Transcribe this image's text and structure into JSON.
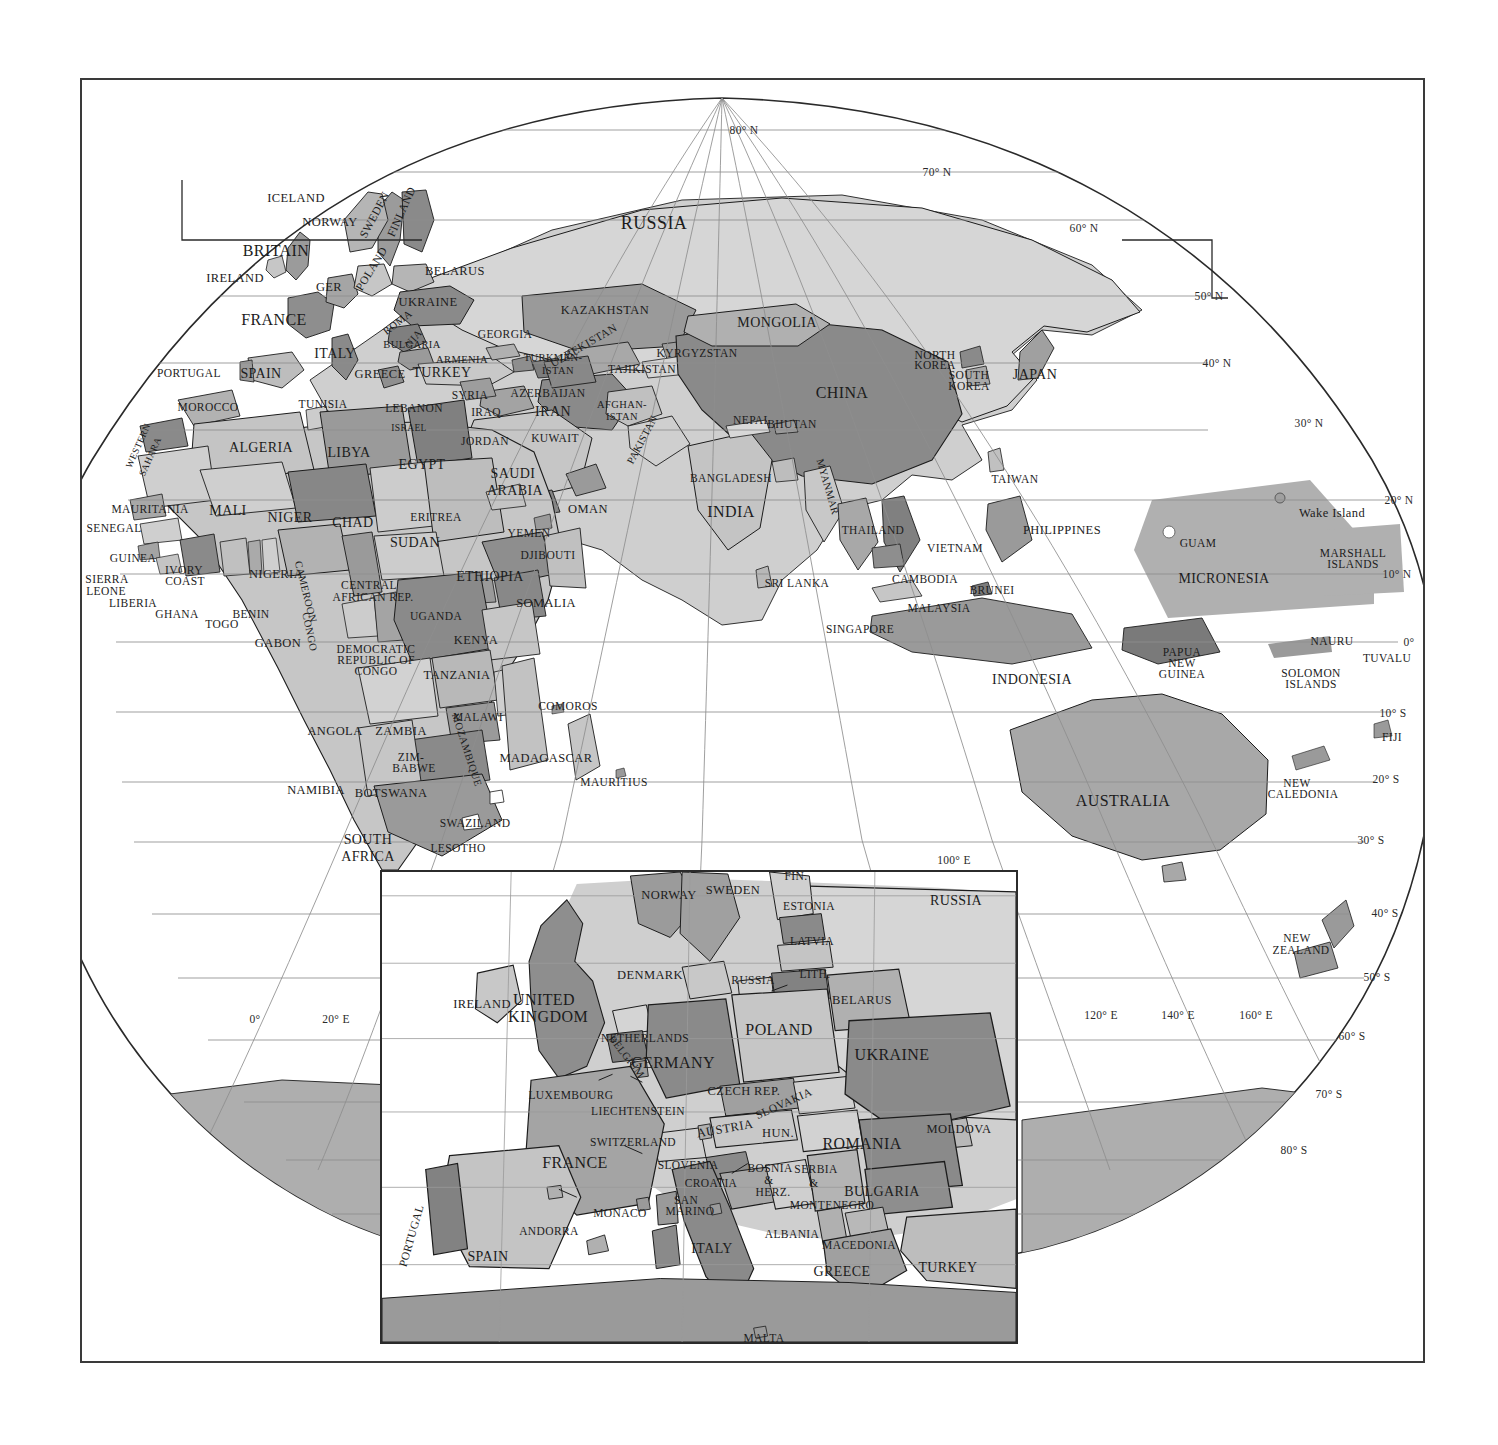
{
  "plate": {
    "title": "World Map — Eastern Hemisphere with Europe Inset",
    "projection": "oblique globe / Bonne-like",
    "frame_color": "#3a3a3a",
    "background": "#ffffff"
  },
  "legend_shades": {
    "ocean": "#ffffff",
    "land_light": "#d2d2d2",
    "land_midlight": "#bfbfbf",
    "land_mid": "#a8a8a8",
    "land_middark": "#949494",
    "land_dark": "#7d7d7d",
    "land_darkest": "#6a6a6a",
    "graticule": "#8a8a8a",
    "border": "#1c1c1c"
  },
  "graticule": {
    "latitude_labels": [
      {
        "text": "80° N",
        "x": 742,
        "y": 128
      },
      {
        "text": "70° N",
        "x": 935,
        "y": 170
      },
      {
        "text": "60° N",
        "x": 1082,
        "y": 226
      },
      {
        "text": "50° N",
        "x": 1207,
        "y": 294
      },
      {
        "text": "40° N",
        "x": 1215,
        "y": 361
      },
      {
        "text": "30° N",
        "x": 1307,
        "y": 421
      },
      {
        "text": "20° N",
        "x": 1397,
        "y": 498
      },
      {
        "text": "10° N",
        "x": 1395,
        "y": 572
      },
      {
        "text": "0°",
        "x": 1407,
        "y": 640
      },
      {
        "text": "10° S",
        "x": 1391,
        "y": 711
      },
      {
        "text": "20° S",
        "x": 1384,
        "y": 777
      },
      {
        "text": "30° S",
        "x": 1369,
        "y": 838
      },
      {
        "text": "40° S",
        "x": 1383,
        "y": 911
      },
      {
        "text": "50° S",
        "x": 1375,
        "y": 975
      },
      {
        "text": "60° S",
        "x": 1350,
        "y": 1034
      },
      {
        "text": "70° S",
        "x": 1327,
        "y": 1092
      },
      {
        "text": "80° S",
        "x": 1292,
        "y": 1148
      }
    ],
    "longitude_labels": [
      {
        "text": "0°",
        "x": 253,
        "y": 1017
      },
      {
        "text": "20° E",
        "x": 334,
        "y": 1017
      },
      {
        "text": "100° E",
        "x": 952,
        "y": 858
      },
      {
        "text": "120° E",
        "x": 1099,
        "y": 1013
      },
      {
        "text": "140° E",
        "x": 1176,
        "y": 1013
      },
      {
        "text": "160° E",
        "x": 1254,
        "y": 1013
      }
    ]
  },
  "main_map_labels": [
    {
      "text": "ICELAND",
      "x": 294,
      "y": 196,
      "size": "s12"
    },
    {
      "text": "NORWAY",
      "x": 328,
      "y": 220,
      "size": "s12"
    },
    {
      "text": "SWEDEN",
      "x": 373,
      "y": 213,
      "size": "s11",
      "rot": -62
    },
    {
      "text": "FINLAND",
      "x": 400,
      "y": 210,
      "size": "s11",
      "rot": -66
    },
    {
      "text": "BRITAIN",
      "x": 274,
      "y": 249,
      "size": "s15"
    },
    {
      "text": "IRELAND",
      "x": 233,
      "y": 276,
      "size": "s12"
    },
    {
      "text": "GER",
      "x": 327,
      "y": 285,
      "size": "s12"
    },
    {
      "text": "POLAND",
      "x": 370,
      "y": 267,
      "size": "s11",
      "rot": -58
    },
    {
      "text": "BELARUS",
      "x": 453,
      "y": 269,
      "size": "s12"
    },
    {
      "text": "UKRAINE",
      "x": 426,
      "y": 300,
      "size": "s12"
    },
    {
      "text": "FRANCE",
      "x": 272,
      "y": 318,
      "size": "s15"
    },
    {
      "text": "ROMA",
      "x": 396,
      "y": 321,
      "size": "s10",
      "rot": -38
    },
    {
      "text": "NIA",
      "x": 412,
      "y": 337,
      "size": "s10",
      "rot": -48
    },
    {
      "text": "BULGARIA",
      "x": 410,
      "y": 343,
      "size": "s10"
    },
    {
      "text": "ITALY",
      "x": 333,
      "y": 352,
      "size": "s13"
    },
    {
      "text": "GREECE",
      "x": 378,
      "y": 372,
      "size": "s12"
    },
    {
      "text": "ARMENIA",
      "x": 460,
      "y": 358,
      "size": "s10"
    },
    {
      "text": "GEORGIA",
      "x": 503,
      "y": 333,
      "size": "s11"
    },
    {
      "text": "TURKEY",
      "x": 440,
      "y": 371,
      "size": "s13"
    },
    {
      "text": "PORTUGAL",
      "x": 187,
      "y": 372,
      "size": "s11"
    },
    {
      "text": "SPAIN",
      "x": 259,
      "y": 372,
      "size": "s13"
    },
    {
      "text": "MOROCCO",
      "x": 206,
      "y": 406,
      "size": "s11"
    },
    {
      "text": "TUNISIA",
      "x": 321,
      "y": 403,
      "size": "s11"
    },
    {
      "text": "LEBANON",
      "x": 412,
      "y": 407,
      "size": "s11"
    },
    {
      "text": "SYRIA",
      "x": 468,
      "y": 394,
      "size": "s11"
    },
    {
      "text": "IRAQ",
      "x": 484,
      "y": 411,
      "size": "s11"
    },
    {
      "text": "ISRAEL",
      "x": 407,
      "y": 427,
      "size": "s9"
    },
    {
      "text": "JORDAN",
      "x": 483,
      "y": 440,
      "size": "s11"
    },
    {
      "text": "KUWAIT",
      "x": 553,
      "y": 437,
      "size": "s11"
    },
    {
      "text": "IRAN",
      "x": 551,
      "y": 410,
      "size": "s13"
    },
    {
      "text": "AZERBAIJAN",
      "x": 546,
      "y": 392,
      "size": "s11"
    },
    {
      "text": "TURKMEN-",
      "x": 551,
      "y": 356,
      "size": "s10"
    },
    {
      "text": "ISTAN",
      "x": 556,
      "y": 369,
      "size": "s10"
    },
    {
      "text": "UZBEKISTAN",
      "x": 582,
      "y": 344,
      "size": "s11",
      "rot": -30
    },
    {
      "text": "KYRGYZSTAN",
      "x": 695,
      "y": 352,
      "size": "s11"
    },
    {
      "text": "TAJIKISTAN",
      "x": 640,
      "y": 368,
      "size": "s11"
    },
    {
      "text": "KAZAKHSTAN",
      "x": 603,
      "y": 308,
      "size": "s12"
    },
    {
      "text": "AFGHAN-",
      "x": 620,
      "y": 403,
      "size": "s10"
    },
    {
      "text": "ISTAN",
      "x": 620,
      "y": 415,
      "size": "s10"
    },
    {
      "text": "PAKISTAN",
      "x": 641,
      "y": 438,
      "size": "s10",
      "rot": -62
    },
    {
      "text": "WESTERN",
      "x": 137,
      "y": 444,
      "size": "s9",
      "rot": -66
    },
    {
      "text": "SAHARA",
      "x": 149,
      "y": 455,
      "size": "s9",
      "rot": -66
    },
    {
      "text": "ALGERIA",
      "x": 259,
      "y": 446,
      "size": "s13"
    },
    {
      "text": "LIBYA",
      "x": 347,
      "y": 451,
      "size": "s13"
    },
    {
      "text": "EGYPT",
      "x": 420,
      "y": 463,
      "size": "s13"
    },
    {
      "text": "SAUDI",
      "x": 511,
      "y": 472,
      "size": "s13"
    },
    {
      "text": "ARABIA",
      "x": 513,
      "y": 489,
      "size": "s13"
    },
    {
      "text": "MAURITANIA",
      "x": 148,
      "y": 508,
      "size": "s11"
    },
    {
      "text": "MALI",
      "x": 226,
      "y": 509,
      "size": "s13"
    },
    {
      "text": "NIGER",
      "x": 288,
      "y": 516,
      "size": "s13"
    },
    {
      "text": "CHAD",
      "x": 351,
      "y": 521,
      "size": "s13"
    },
    {
      "text": "ERITREA",
      "x": 434,
      "y": 516,
      "size": "s11"
    },
    {
      "text": "SUDAN",
      "x": 413,
      "y": 541,
      "size": "s13"
    },
    {
      "text": "OMAN",
      "x": 586,
      "y": 507,
      "size": "s12"
    },
    {
      "text": "YEMEN",
      "x": 527,
      "y": 532,
      "size": "s11"
    },
    {
      "text": "DJIBOUTI",
      "x": 546,
      "y": 554,
      "size": "s11"
    },
    {
      "text": "INDIA",
      "x": 729,
      "y": 510,
      "size": "s15"
    },
    {
      "text": "NEPAL",
      "x": 750,
      "y": 419,
      "size": "s11"
    },
    {
      "text": "BHUTAN",
      "x": 790,
      "y": 423,
      "size": "s11"
    },
    {
      "text": "BANGLADESH",
      "x": 729,
      "y": 477,
      "size": "s11"
    },
    {
      "text": "MYANMAR",
      "x": 825,
      "y": 485,
      "size": "s10",
      "rot": 74
    },
    {
      "text": "MONGOLIA",
      "x": 775,
      "y": 321,
      "size": "s13"
    },
    {
      "text": "CHINA",
      "x": 840,
      "y": 391,
      "size": "s15"
    },
    {
      "text": "RUSSIA",
      "x": 652,
      "y": 221,
      "size": "s17"
    },
    {
      "text": "NORTH",
      "x": 933,
      "y": 354,
      "size": "s11"
    },
    {
      "text": "KOREA",
      "x": 933,
      "y": 364,
      "size": "s11"
    },
    {
      "text": "SOUTH",
      "x": 967,
      "y": 374,
      "size": "s11"
    },
    {
      "text": "KOREA",
      "x": 967,
      "y": 385,
      "size": "s11"
    },
    {
      "text": "JAPAN",
      "x": 1033,
      "y": 373,
      "size": "s13"
    },
    {
      "text": "TAIWAN",
      "x": 1013,
      "y": 478,
      "size": "s11"
    },
    {
      "text": "SENEGAL",
      "x": 112,
      "y": 527,
      "size": "s11"
    },
    {
      "text": "GUINEA",
      "x": 131,
      "y": 557,
      "size": "s11"
    },
    {
      "text": "SIERRA",
      "x": 105,
      "y": 578,
      "size": "s11"
    },
    {
      "text": "LEONE",
      "x": 104,
      "y": 590,
      "size": "s11"
    },
    {
      "text": "LIBERIA",
      "x": 131,
      "y": 602,
      "size": "s11"
    },
    {
      "text": "GHANA",
      "x": 175,
      "y": 613,
      "size": "s11"
    },
    {
      "text": "IVORY",
      "x": 182,
      "y": 569,
      "size": "s11"
    },
    {
      "text": "COAST",
      "x": 183,
      "y": 580,
      "size": "s11"
    },
    {
      "text": "TOGO",
      "x": 220,
      "y": 623,
      "size": "s11"
    },
    {
      "text": "BENIN",
      "x": 249,
      "y": 613,
      "size": "s11"
    },
    {
      "text": "NIGERIA",
      "x": 274,
      "y": 572,
      "size": "s12"
    },
    {
      "text": "CAMEROON",
      "x": 303,
      "y": 590,
      "size": "s10",
      "rot": 76
    },
    {
      "text": "CENTRAL",
      "x": 367,
      "y": 584,
      "size": "s11"
    },
    {
      "text": "AFRICAN REP.",
      "x": 371,
      "y": 596,
      "size": "s11"
    },
    {
      "text": "ETHIOPIA",
      "x": 488,
      "y": 575,
      "size": "s13"
    },
    {
      "text": "SOMALIA",
      "x": 544,
      "y": 601,
      "size": "s12"
    },
    {
      "text": "UGANDA",
      "x": 434,
      "y": 615,
      "size": "s11"
    },
    {
      "text": "KENYA",
      "x": 474,
      "y": 638,
      "size": "s12"
    },
    {
      "text": "GABON",
      "x": 276,
      "y": 641,
      "size": "s12"
    },
    {
      "text": "CONGO",
      "x": 307,
      "y": 630,
      "size": "s10",
      "rot": 78
    },
    {
      "text": "DEMOCRATIC",
      "x": 374,
      "y": 648,
      "size": "s11"
    },
    {
      "text": "REPUBLIC OF",
      "x": 374,
      "y": 659,
      "size": "s11"
    },
    {
      "text": "CONGO",
      "x": 374,
      "y": 670,
      "size": "s11"
    },
    {
      "text": "TANZANIA",
      "x": 455,
      "y": 673,
      "size": "s12"
    },
    {
      "text": "COMOROS",
      "x": 566,
      "y": 705,
      "size": "s11"
    },
    {
      "text": "MALAWI",
      "x": 476,
      "y": 716,
      "size": "s11"
    },
    {
      "text": "ANGOLA",
      "x": 333,
      "y": 729,
      "size": "s12"
    },
    {
      "text": "ZAMBIA",
      "x": 399,
      "y": 729,
      "size": "s12"
    },
    {
      "text": "MOZAMBIQUE",
      "x": 464,
      "y": 748,
      "size": "s10",
      "rot": 72
    },
    {
      "text": "MADAGASCAR",
      "x": 544,
      "y": 756,
      "size": "s12"
    },
    {
      "text": "MAURITIUS",
      "x": 612,
      "y": 781,
      "size": "s11"
    },
    {
      "text": "ZIM-",
      "x": 409,
      "y": 756,
      "size": "s11"
    },
    {
      "text": "BABWE",
      "x": 412,
      "y": 767,
      "size": "s11"
    },
    {
      "text": "NAMIBIA",
      "x": 314,
      "y": 788,
      "size": "s12"
    },
    {
      "text": "BOTSWANA",
      "x": 389,
      "y": 791,
      "size": "s12"
    },
    {
      "text": "SWAZILAND",
      "x": 473,
      "y": 822,
      "size": "s11"
    },
    {
      "text": "SOUTH",
      "x": 366,
      "y": 838,
      "size": "s13"
    },
    {
      "text": "AFRICA",
      "x": 366,
      "y": 855,
      "size": "s13"
    },
    {
      "text": "LESOTHO",
      "x": 456,
      "y": 847,
      "size": "s11"
    },
    {
      "text": "SRI LANKA",
      "x": 795,
      "y": 582,
      "size": "s11"
    },
    {
      "text": "THAILAND",
      "x": 871,
      "y": 529,
      "size": "s11"
    },
    {
      "text": "VIETNAM",
      "x": 953,
      "y": 547,
      "size": "s11"
    },
    {
      "text": "CAMBODIA",
      "x": 923,
      "y": 578,
      "size": "s11"
    },
    {
      "text": "MALAYSIA",
      "x": 937,
      "y": 607,
      "size": "s11"
    },
    {
      "text": "SINGAPORE",
      "x": 858,
      "y": 628,
      "size": "s11"
    },
    {
      "text": "BRUNEI",
      "x": 990,
      "y": 589,
      "size": "s11"
    },
    {
      "text": "PHILIPPINES",
      "x": 1060,
      "y": 528,
      "size": "s12"
    },
    {
      "text": "INDONESIA",
      "x": 1030,
      "y": 678,
      "size": "s13"
    },
    {
      "text": "PAPUA",
      "x": 1180,
      "y": 651,
      "size": "s11"
    },
    {
      "text": "NEW",
      "x": 1180,
      "y": 662,
      "size": "s11"
    },
    {
      "text": "GUINEA",
      "x": 1180,
      "y": 673,
      "size": "s11"
    },
    {
      "text": "SOLOMON",
      "x": 1309,
      "y": 672,
      "size": "s11"
    },
    {
      "text": "ISLANDS",
      "x": 1309,
      "y": 683,
      "size": "s11"
    },
    {
      "text": "NAURU",
      "x": 1330,
      "y": 640,
      "size": "s11"
    },
    {
      "text": "TUVALU",
      "x": 1385,
      "y": 657,
      "size": "s11"
    },
    {
      "text": "FIJI",
      "x": 1390,
      "y": 736,
      "size": "s11"
    },
    {
      "text": "NEW",
      "x": 1295,
      "y": 782,
      "size": "s11"
    },
    {
      "text": "CALEDONIA",
      "x": 1301,
      "y": 793,
      "size": "s11"
    },
    {
      "text": "AUSTRALIA",
      "x": 1121,
      "y": 799,
      "size": "s15"
    },
    {
      "text": "NEW",
      "x": 1295,
      "y": 937,
      "size": "s11"
    },
    {
      "text": "ZEALAND",
      "x": 1299,
      "y": 949,
      "size": "s11"
    },
    {
      "text": "MICRONESIA",
      "x": 1222,
      "y": 577,
      "size": "s13"
    },
    {
      "text": "GUAM",
      "x": 1196,
      "y": 542,
      "size": "s11"
    },
    {
      "text": "Wake Island",
      "x": 1330,
      "y": 511,
      "size": "s12"
    },
    {
      "text": "MARSHALL",
      "x": 1351,
      "y": 552,
      "size": "s11"
    },
    {
      "text": "ISLANDS",
      "x": 1351,
      "y": 563,
      "size": "s11"
    }
  ],
  "inset": {
    "title": "Europe detail inset",
    "labels": [
      {
        "text": "NORWAY",
        "x": 665,
        "y": 891,
        "size": "s12"
      },
      {
        "text": "SWEDEN",
        "x": 729,
        "y": 886,
        "size": "s12"
      },
      {
        "text": "FIN.",
        "x": 792,
        "y": 873,
        "size": "s11"
      },
      {
        "text": "ESTONIA",
        "x": 805,
        "y": 903,
        "size": "s11"
      },
      {
        "text": "DENMARK",
        "x": 646,
        "y": 971,
        "size": "s12"
      },
      {
        "text": "LATVIA",
        "x": 808,
        "y": 938,
        "size": "s11"
      },
      {
        "text": "LITH.",
        "x": 811,
        "y": 971,
        "size": "s11"
      },
      {
        "text": "RUSSIA",
        "x": 749,
        "y": 977,
        "size": "s11"
      },
      {
        "text": "RUSSIA",
        "x": 952,
        "y": 897,
        "size": "s13"
      },
      {
        "text": "BELARUS",
        "x": 858,
        "y": 996,
        "size": "s12"
      },
      {
        "text": "IRELAND",
        "x": 478,
        "y": 1000,
        "size": "s12"
      },
      {
        "text": "UNITED",
        "x": 540,
        "y": 996,
        "size": "s15"
      },
      {
        "text": "KINGDOM",
        "x": 544,
        "y": 1013,
        "size": "s15"
      },
      {
        "text": "POLAND",
        "x": 775,
        "y": 1026,
        "size": "s15"
      },
      {
        "text": "NETHERLANDS",
        "x": 641,
        "y": 1035,
        "size": "s11"
      },
      {
        "text": "BELGIUM",
        "x": 622,
        "y": 1053,
        "size": "s10",
        "rot": 52
      },
      {
        "text": "GERMANY",
        "x": 669,
        "y": 1059,
        "size": "s15"
      },
      {
        "text": "UKRAINE",
        "x": 888,
        "y": 1051,
        "size": "s15"
      },
      {
        "text": "LUXEMBOURG",
        "x": 567,
        "y": 1092,
        "size": "s11"
      },
      {
        "text": "CZECH REP.",
        "x": 740,
        "y": 1087,
        "size": "s12"
      },
      {
        "text": "SLOVAKIA",
        "x": 780,
        "y": 1100,
        "size": "s11",
        "rot": -24
      },
      {
        "text": "LIECHTENSTEIN",
        "x": 634,
        "y": 1108,
        "size": "s11"
      },
      {
        "text": "AUSTRIA",
        "x": 721,
        "y": 1125,
        "size": "s12",
        "rot": -10
      },
      {
        "text": "HUN.",
        "x": 774,
        "y": 1129,
        "size": "s12"
      },
      {
        "text": "MOLDOVA",
        "x": 955,
        "y": 1125,
        "size": "s12"
      },
      {
        "text": "SWITZERLAND",
        "x": 629,
        "y": 1139,
        "size": "s11"
      },
      {
        "text": "ROMANIA",
        "x": 858,
        "y": 1140,
        "size": "s15"
      },
      {
        "text": "FRANCE",
        "x": 571,
        "y": 1159,
        "size": "s15"
      },
      {
        "text": "SLOVENIA",
        "x": 684,
        "y": 1162,
        "size": "s11"
      },
      {
        "text": "CROATIA",
        "x": 707,
        "y": 1180,
        "size": "s11"
      },
      {
        "text": "BOSNIA",
        "x": 766,
        "y": 1165,
        "size": "s11"
      },
      {
        "text": "&",
        "x": 765,
        "y": 1177,
        "size": "s11"
      },
      {
        "text": "HERZ.",
        "x": 769,
        "y": 1189,
        "size": "s11"
      },
      {
        "text": "SERBIA",
        "x": 812,
        "y": 1166,
        "size": "s11"
      },
      {
        "text": "&",
        "x": 810,
        "y": 1180,
        "size": "s11"
      },
      {
        "text": "MONTENEGRO",
        "x": 828,
        "y": 1202,
        "size": "s11"
      },
      {
        "text": "BULGARIA",
        "x": 878,
        "y": 1188,
        "size": "s13"
      },
      {
        "text": "SAN",
        "x": 682,
        "y": 1197,
        "size": "s11"
      },
      {
        "text": "MARINO",
        "x": 686,
        "y": 1208,
        "size": "s11"
      },
      {
        "text": "MONACO",
        "x": 616,
        "y": 1210,
        "size": "s11"
      },
      {
        "text": "ANDORRA",
        "x": 545,
        "y": 1228,
        "size": "s11"
      },
      {
        "text": "PORTUGAL",
        "x": 408,
        "y": 1232,
        "size": "s11",
        "rot": -74
      },
      {
        "text": "SPAIN",
        "x": 484,
        "y": 1253,
        "size": "s13"
      },
      {
        "text": "ITALY",
        "x": 708,
        "y": 1245,
        "size": "s13"
      },
      {
        "text": "ALBANIA",
        "x": 788,
        "y": 1231,
        "size": "s11"
      },
      {
        "text": "MACEDONIA",
        "x": 855,
        "y": 1242,
        "size": "s11"
      },
      {
        "text": "GREECE",
        "x": 838,
        "y": 1268,
        "size": "s13"
      },
      {
        "text": "TURKEY",
        "x": 944,
        "y": 1264,
        "size": "s13"
      },
      {
        "text": "MALTA",
        "x": 760,
        "y": 1335,
        "size": "s11"
      }
    ]
  }
}
